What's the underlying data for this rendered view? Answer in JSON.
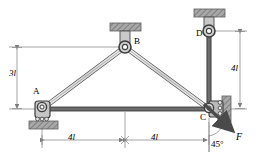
{
  "diagram": {
    "type": "statics-free-body-diagram",
    "nodes": [
      {
        "id": "A",
        "label": "A",
        "x": 42,
        "y": 109,
        "support": "roller-on-ground",
        "label_x": 33,
        "label_y": 92
      },
      {
        "id": "B",
        "label": "B",
        "x": 125,
        "y": 47,
        "support": "pin-from-ceiling",
        "label_x": 134,
        "label_y": 41
      },
      {
        "id": "C",
        "label": "C",
        "x": 209,
        "y": 109,
        "support": "roller-on-wall",
        "label_x": 201,
        "label_y": 116
      },
      {
        "id": "D",
        "label": "D",
        "x": 209,
        "y": 32,
        "support": "pin-from-ceiling",
        "label_x": 197,
        "label_y": 34
      }
    ],
    "members": [
      {
        "from": "A",
        "to": "B"
      },
      {
        "from": "B",
        "to": "C"
      },
      {
        "from": "A",
        "to": "C"
      },
      {
        "from": "D",
        "to": "C"
      }
    ],
    "dimensions": [
      {
        "name": "height-left",
        "label": "3l",
        "orientation": "vertical",
        "label_x": 13,
        "label_y": 73
      },
      {
        "name": "height-right",
        "label": "4l",
        "orientation": "vertical",
        "label_x": 233,
        "label_y": 68
      },
      {
        "name": "span-left",
        "label": "4l",
        "orientation": "horizontal",
        "label_x": 69,
        "label_y": 136
      },
      {
        "name": "span-right",
        "label": "4l",
        "orientation": "horizontal",
        "label_x": 152,
        "label_y": 136
      }
    ],
    "load": {
      "label": "F",
      "angle_label": "45°",
      "angle_value": 45,
      "angle_reference": "vertical",
      "label_x": 238,
      "label_y": 138,
      "angle_label_x": 215,
      "angle_label_y": 142
    },
    "colors": {
      "stroke": "#3a3a3a",
      "member_fill": "#d8d8d8",
      "hatch_fill": "#9a9a9a",
      "dimension_line": "#8a8a8a",
      "background": "#ffffff",
      "text": "#000000"
    }
  }
}
